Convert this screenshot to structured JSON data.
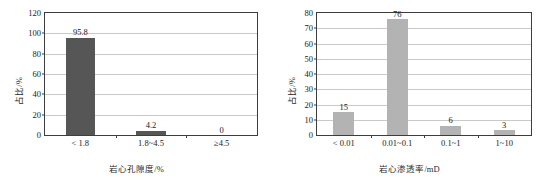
{
  "figure": {
    "panels": [
      "porosity",
      "permeability"
    ],
    "bar_color_left": "#565656",
    "bar_color_right": "#b3b3b3",
    "frame_color": "#3d3d3d",
    "grid_color": "#c9c9c9"
  },
  "chart_data": [
    {
      "type": "bar",
      "title": "",
      "xlabel": "岩心孔隙度/%",
      "ylabel": "占比/%",
      "categories": [
        "< 1.8",
        "1.8~4.5",
        "≥4.5"
      ],
      "values": [
        95.8,
        4.2,
        0
      ],
      "value_labels": [
        "95.8",
        "4.2",
        "0"
      ],
      "ylim": [
        0,
        120
      ],
      "yticks": [
        0,
        20,
        40,
        60,
        80,
        100,
        120
      ],
      "ytick_labels": [
        "0",
        "20",
        "40",
        "60",
        "80",
        "100",
        "120"
      ],
      "grid": true,
      "legend": "none"
    },
    {
      "type": "bar",
      "title": "",
      "xlabel": "岩心渗透率/mD",
      "ylabel": "占比/%",
      "categories": [
        "< 0.01",
        "0.01~0.1",
        "0.1~1",
        "1~10"
      ],
      "values": [
        15,
        76,
        6,
        3
      ],
      "value_labels": [
        "15",
        "76",
        "6",
        "3"
      ],
      "ylim": [
        0,
        80
      ],
      "yticks": [
        0,
        10,
        20,
        30,
        40,
        50,
        60,
        70,
        80
      ],
      "ytick_labels": [
        "0",
        "10",
        "20",
        "30",
        "40",
        "50",
        "60",
        "70",
        "80"
      ],
      "grid": true,
      "legend": "none"
    }
  ]
}
